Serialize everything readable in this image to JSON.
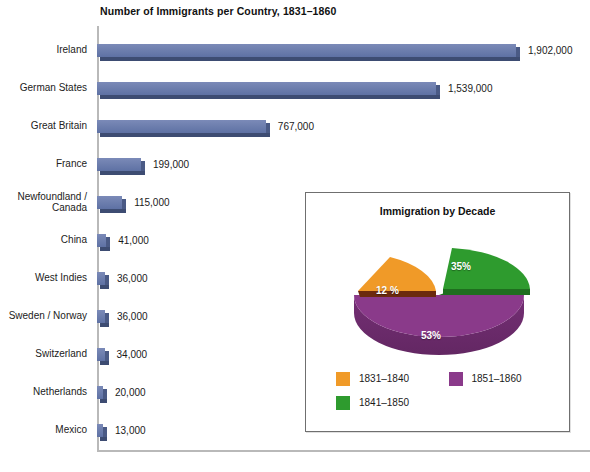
{
  "chart_data": [
    {
      "type": "bar",
      "title": "Number of Immigrants per Country, 1831–1860",
      "orientation": "horizontal",
      "xlabel": "",
      "ylabel": "",
      "grid": false,
      "xlim": [
        0,
        1902000
      ],
      "categories": [
        "Ireland",
        "German States",
        "Great Britain",
        "France",
        "Newfoundland /\nCanada",
        "China",
        "West Indies",
        "Sweden / Norway",
        "Switzerland",
        "Netherlands",
        "Mexico"
      ],
      "values": [
        1902000,
        1539000,
        767000,
        199000,
        115000,
        41000,
        36000,
        36000,
        34000,
        20000,
        13000
      ],
      "value_labels": [
        "1,902,000",
        "1,539,000",
        "767,000",
        "199,000",
        "115,000",
        "41,000",
        "36,000",
        "36,000",
        "34,000",
        "20,000",
        "13,000"
      ],
      "bar_color": "#6E7FAE"
    },
    {
      "type": "pie",
      "title": "Immigration by Decade",
      "labels": [
        "1831–1840",
        "1841–1850",
        "1851–1860"
      ],
      "values": [
        12,
        35,
        53
      ],
      "data_labels": [
        "12 %",
        "35%",
        "53%"
      ],
      "colors": [
        "#F09A28",
        "#2E9B2E",
        "#8A3A8A"
      ],
      "legend_position": "bottom",
      "exploded_slices": [
        "1831–1840"
      ]
    }
  ],
  "bar_chart": {
    "title": "Number of Immigrants per Country, 1831–1860",
    "rows": [
      {
        "label": "Ireland",
        "value": "1,902,000",
        "pct": 100.0
      },
      {
        "label": "German States",
        "value": "1,539,000",
        "pct": 80.9
      },
      {
        "label": "Great Britain",
        "value": "767,000",
        "pct": 40.3
      },
      {
        "label": "France",
        "value": "199,000",
        "pct": 10.5
      },
      {
        "label": "Newfoundland /\nCanada",
        "value": "115,000",
        "pct": 6.0
      },
      {
        "label": "China",
        "value": "41,000",
        "pct": 2.2
      },
      {
        "label": "West Indies",
        "value": "36,000",
        "pct": 1.9
      },
      {
        "label": "Sweden / Norway",
        "value": "36,000",
        "pct": 1.9
      },
      {
        "label": "Switzerland",
        "value": "34,000",
        "pct": 1.8
      },
      {
        "label": "Netherlands",
        "value": "20,000",
        "pct": 1.1
      },
      {
        "label": "Mexico",
        "value": "13,000",
        "pct": 0.7
      }
    ]
  },
  "pie_chart": {
    "title": "Immigration by Decade",
    "slices": [
      {
        "label": "1831–1840",
        "pct_label": "12 %",
        "value": 12,
        "color": "#F09A28"
      },
      {
        "label": "1841–1850",
        "pct_label": "35%",
        "value": 35,
        "color": "#2E9B2E"
      },
      {
        "label": "1851–1860",
        "pct_label": "53%",
        "value": 53,
        "color": "#8A3A8A"
      }
    ],
    "legend": [
      {
        "label": "1831–1840",
        "color": "#F09A28"
      },
      {
        "label": "1851–1860",
        "color": "#8A3A8A"
      },
      {
        "label": "1841–1850",
        "color": "#2E9B2E"
      }
    ]
  },
  "colors": {
    "bar": "#6E7FAE",
    "bar_shadow": "#3D4C72",
    "orange": "#F09A28",
    "green": "#2E9B2E",
    "purple": "#8A3A8A",
    "axis": "#B9B9B9"
  }
}
